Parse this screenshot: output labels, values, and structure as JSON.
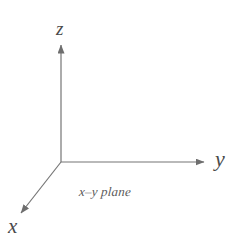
{
  "figure": {
    "background_color": "#ffffff",
    "line_color": "#757575",
    "text_color": "#4a4a4a",
    "width": 236,
    "height": 239
  },
  "axes": {
    "origin": {
      "x": 61,
      "y": 162
    },
    "items": [
      {
        "name": "z",
        "label": "z",
        "direction": "up",
        "tip": {
          "x": 61,
          "y": 42
        },
        "label_position": {
          "x": 56,
          "y": 19
        }
      },
      {
        "name": "y",
        "label": "y",
        "direction": "right",
        "tip": {
          "x": 207,
          "y": 162
        },
        "label_position": {
          "x": 215,
          "y": 148
        }
      },
      {
        "name": "x",
        "label": "x",
        "direction": "down-left",
        "tip": {
          "x": 18,
          "y": 216
        },
        "label_position": {
          "x": 8,
          "y": 216
        }
      }
    ]
  },
  "annotations": {
    "plane_label": "x–y plane"
  }
}
